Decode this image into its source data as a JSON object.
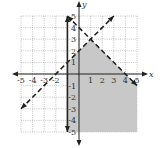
{
  "chart_data": {
    "type": "inequality-graph",
    "title": "",
    "xlabel": "x",
    "ylabel": "y",
    "xlim": [
      -5,
      5
    ],
    "ylim": [
      -5,
      5
    ],
    "grid": true,
    "x_ticks": [
      "-5",
      "-4",
      "-3",
      "-2",
      "",
      "1",
      "2",
      "3",
      "4",
      "5"
    ],
    "y_ticks": [
      "5",
      "4",
      "3",
      "2",
      "1",
      "-1",
      "-2",
      "-3",
      "-4",
      "-5"
    ],
    "boundaries": [
      {
        "name": "x = -1",
        "style": "solid",
        "points": [
          [
            -1,
            5
          ],
          [
            -1,
            -5
          ]
        ]
      },
      {
        "name": "y = x + 2",
        "style": "dashed",
        "points": [
          [
            -5,
            -3
          ],
          [
            3,
            5
          ]
        ]
      },
      {
        "name": "y = -x + 4",
        "style": "dashed",
        "points": [
          [
            -1,
            5
          ],
          [
            5,
            -1
          ]
        ]
      }
    ],
    "intersection": [
      1,
      3
    ],
    "shaded_region": {
      "description": "x >= -1, y < x + 2, y < -x + 4",
      "vertices": [
        [
          -1,
          -5
        ],
        [
          -1,
          1
        ],
        [
          1,
          3
        ],
        [
          5,
          -1
        ],
        [
          5,
          -5
        ]
      ],
      "color": "#c8c8c8"
    }
  },
  "colors": {
    "line": "#222222",
    "grid": "#9a9a9a",
    "shade": "#c8c8c8"
  }
}
